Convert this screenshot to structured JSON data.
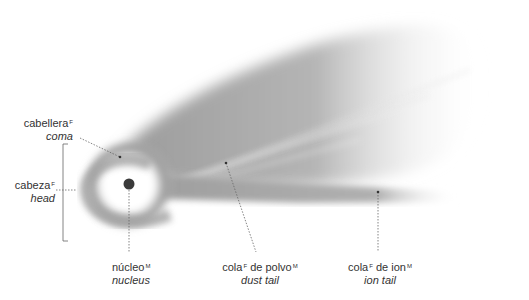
{
  "diagram": {
    "labels": [
      {
        "id": "coma",
        "es": "cabellera",
        "es_gender": "F",
        "en": "coma"
      },
      {
        "id": "head",
        "es": "cabeza",
        "es_gender": "F",
        "en": "head"
      },
      {
        "id": "nucleus",
        "es": "núcleo",
        "es_gender": "M",
        "en": "nucleus"
      },
      {
        "id": "dust-tail",
        "es": "cola",
        "es_gender": "F",
        "es_suffix": " de polvo",
        "es_suffix_gender": "M",
        "en": "dust tail"
      },
      {
        "id": "ion-tail",
        "es": "cola",
        "es_gender": "F",
        "es_suffix": " de ion",
        "es_suffix_gender": "M",
        "en": "ion tail"
      }
    ]
  }
}
